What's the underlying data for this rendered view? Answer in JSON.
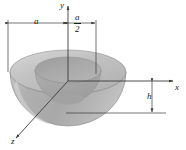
{
  "figure": {
    "background_color": "#ffffff",
    "line_color": "#3a3a3a",
    "text_color": "#1a1a1a",
    "axes": [
      {
        "id": "y",
        "label": "y",
        "orientation": "vertical-up"
      },
      {
        "id": "x",
        "label": "x",
        "orientation": "horizontal-right"
      },
      {
        "id": "z",
        "label": "z",
        "orientation": "diagonal-down-left"
      }
    ],
    "dimensions": [
      {
        "id": "a",
        "label": "a",
        "kind": "horizontal",
        "note": "outer radius, left of y-axis"
      },
      {
        "id": "a-over-2",
        "numerator": "a",
        "denominator": "2",
        "kind": "horizontal",
        "note": "inner radius, right of y-axis"
      },
      {
        "id": "h",
        "label": "h",
        "kind": "vertical",
        "note": "depth below x-axis to bottom of inner cavity"
      }
    ],
    "solid": {
      "kind": "hemispherical-bowl",
      "outer_top_fill": "#b9b9b9",
      "outer_body_fill": "#b2b2b2",
      "inner_rim_fill": "#a6a6a6",
      "inner_cavity_fill": "#9e9e9e",
      "highlight_fill": "#cfcfcf",
      "outline_color": "#8a8a8a"
    }
  }
}
